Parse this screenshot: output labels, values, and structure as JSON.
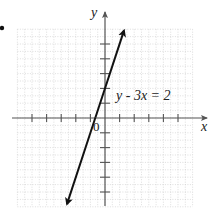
{
  "chart_data": {
    "type": "line",
    "title": "",
    "xlabel": "x",
    "ylabel": "y",
    "origin_label": "0",
    "xlim": [
      -6,
      6
    ],
    "ylim": [
      -6,
      6
    ],
    "grid": true,
    "grid_style": "dotted",
    "x_ticks": [
      -5,
      -4,
      -3,
      -2,
      -1,
      1,
      2,
      3,
      4,
      5
    ],
    "y_ticks": [
      -5,
      -4,
      -3,
      -2,
      -1,
      1,
      2,
      3,
      4,
      5
    ],
    "series": [
      {
        "name": "y - 3x = 2",
        "equation": "y = 3x + 2",
        "slope": 3,
        "intercept": 2,
        "x": [
          -2.6,
          1.3
        ],
        "y": [
          -5.8,
          5.9
        ],
        "arrows": "both"
      }
    ],
    "annotations": [
      {
        "text": "y − 3x = 2",
        "x": 0.8,
        "y": 1.6
      }
    ]
  },
  "bullet": "•",
  "colors": {
    "axis": "#555555",
    "line": "#111111",
    "grid": "#c8c8c8",
    "text": "#222222"
  }
}
